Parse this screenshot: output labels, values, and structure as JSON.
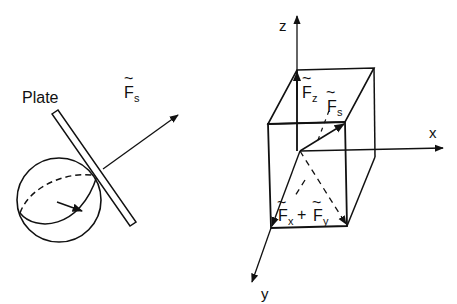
{
  "diagram": {
    "left_panel": {
      "plate_label": "Plate",
      "force_label": {
        "tilde": "~",
        "main": "F",
        "sub": "s"
      }
    },
    "right_panel": {
      "axes": {
        "x": "x",
        "y": "y",
        "z": "z"
      },
      "fz_label": {
        "tilde": "~",
        "main": "F",
        "sub": "z"
      },
      "fs_label": {
        "tilde": "~",
        "main": "F",
        "sub": "s"
      },
      "fxy_label": {
        "tilde1": "~",
        "main1": "F",
        "sub1": "x",
        "plus": "+",
        "tilde2": "~",
        "main2": "F",
        "sub2": "y"
      }
    },
    "colors": {
      "ink": "#111111",
      "background": "#ffffff"
    }
  }
}
